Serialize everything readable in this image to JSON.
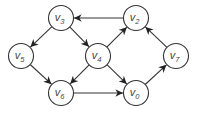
{
  "diagram": {
    "type": "directed-graph",
    "width": 198,
    "height": 113,
    "node_radius": 12.5,
    "colors": {
      "stroke": "#333333",
      "fill": "#ffffff",
      "label": "#444444"
    },
    "nodes": [
      {
        "id": "v0",
        "label": "v",
        "sub": "0",
        "x": 136,
        "y": 93
      },
      {
        "id": "v2",
        "label": "v",
        "sub": "2",
        "x": 136,
        "y": 18
      },
      {
        "id": "v3",
        "label": "v",
        "sub": "3",
        "x": 61,
        "y": 18
      },
      {
        "id": "v4",
        "label": "v",
        "sub": "4",
        "x": 98,
        "y": 56
      },
      {
        "id": "v5",
        "label": "v",
        "sub": "5",
        "x": 21,
        "y": 56
      },
      {
        "id": "v6",
        "label": "v",
        "sub": "6",
        "x": 61,
        "y": 93
      },
      {
        "id": "v7",
        "label": "v",
        "sub": "7",
        "x": 176,
        "y": 56
      }
    ],
    "edges": [
      {
        "from": "v2",
        "to": "v3"
      },
      {
        "from": "v3",
        "to": "v5"
      },
      {
        "from": "v3",
        "to": "v4"
      },
      {
        "from": "v4",
        "to": "v2"
      },
      {
        "from": "v4",
        "to": "v6"
      },
      {
        "from": "v4",
        "to": "v0"
      },
      {
        "from": "v5",
        "to": "v6"
      },
      {
        "from": "v6",
        "to": "v0"
      },
      {
        "from": "v0",
        "to": "v7"
      },
      {
        "from": "v7",
        "to": "v2"
      }
    ]
  }
}
